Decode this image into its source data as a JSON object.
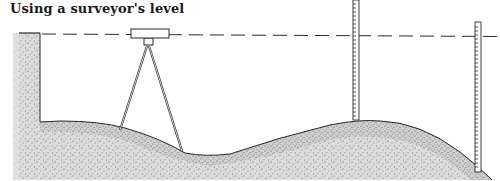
{
  "title": "Using a surveyor's level",
  "colors": {
    "line": "#2a2a2a",
    "ground_fill": "#d6d6d6",
    "stipple": "#5a5a5a",
    "background": "#ffffff"
  },
  "elements": {
    "sight_line": "dashed horizontal line of sight",
    "level_instrument": "surveyor's level on tripod",
    "rod_left": "graduated leveling rod on hilltop",
    "rod_right": "graduated leveling rod on slope",
    "ground": "undulating stippled ground profile",
    "left_block": "stippled embankment wall"
  }
}
